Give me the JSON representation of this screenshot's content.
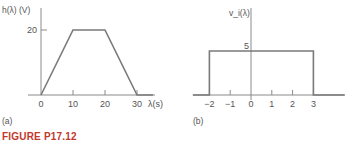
{
  "figure_caption": "FIGURE P17.12",
  "colors": {
    "axis": "#8a8a8a",
    "curve": "#7a7a7a",
    "text": "#555555",
    "caption": "#c0392b"
  },
  "chart_data": [
    {
      "panel_label": "(a)",
      "type": "line",
      "title": "",
      "ylabel": "h(λ) (V)",
      "xlabel": "λ(s)",
      "x_ticks": [
        0,
        10,
        20,
        30
      ],
      "y_ticks": [
        20
      ],
      "x": [
        0,
        10,
        20,
        30,
        35
      ],
      "y": [
        0,
        20,
        20,
        0,
        0
      ],
      "xlim": [
        -5,
        38
      ],
      "ylim": [
        0,
        25
      ],
      "grid": false,
      "description": "Trapezoidal pulse: ramps from 0 at λ=0 to 20 V at λ=10 s, flat to λ=20 s, ramps down to 0 at λ=30 s"
    },
    {
      "panel_label": "(b)",
      "type": "line",
      "title": "",
      "ylabel": "v_i(λ)",
      "xlabel": "",
      "x_ticks": [
        -2,
        -1,
        0,
        1,
        2,
        3
      ],
      "y_ticks": [
        5
      ],
      "x": [
        -2.8,
        -2,
        -2,
        3,
        3,
        4.5
      ],
      "y": [
        0,
        0,
        5,
        5,
        0,
        0
      ],
      "xlim": [
        -2.8,
        4.5
      ],
      "ylim": [
        0,
        9
      ],
      "grid": false,
      "description": "Rectangular pulse of amplitude 5 from λ=-2 to λ=3"
    }
  ],
  "render": [
    {
      "origin_px": [
        41,
        95
      ],
      "x_scale": 3.2,
      "y_scale": 3.25,
      "x_axis_px": [
        28,
        155
      ],
      "y_axis_px": [
        8,
        95
      ],
      "ylabel_pos": [
        2,
        13
      ],
      "xlabel_pos": [
        148,
        107
      ],
      "panel_pos": [
        2,
        124
      ],
      "ytick_label_dx": -13
    },
    {
      "origin_px": [
        251,
        95
      ],
      "x_scale": 20.8,
      "y_scale": 8.8,
      "x_axis_px": [
        193,
        345
      ],
      "y_axis_px": [
        8,
        100
      ],
      "ylabel_pos": [
        229,
        16
      ],
      "xlabel_pos": [
        0,
        0
      ],
      "panel_pos": [
        193,
        124
      ],
      "ytick_label_dx": -5
    }
  ]
}
